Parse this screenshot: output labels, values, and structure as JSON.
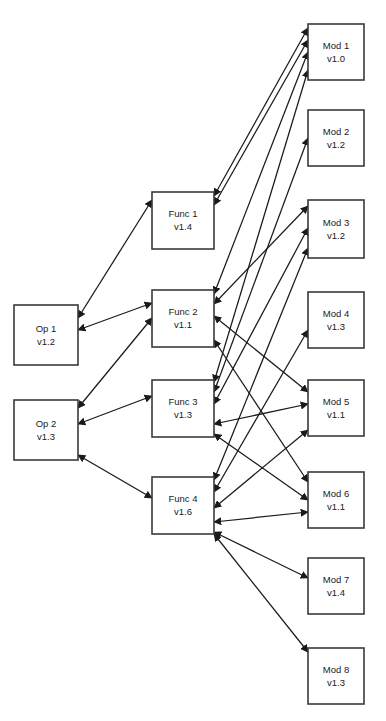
{
  "diagram": {
    "type": "directed-graph",
    "canvas": {
      "width": 386,
      "height": 721,
      "background": "#ffffff"
    },
    "style": {
      "node_fill": "#ffffff",
      "node_stroke": "#3a3a3a",
      "edge_color": "#1a1a1a",
      "text_color": "#1a1a1a"
    },
    "columns": [
      {
        "id": "ops",
        "label": "Op"
      },
      {
        "id": "funcs",
        "label": "Func"
      },
      {
        "id": "mods",
        "label": "Mod"
      }
    ],
    "nodes": [
      {
        "id": "op1",
        "name": "Op 1",
        "version": "v1.2",
        "x": 14,
        "y": 305,
        "w": 64,
        "h": 60,
        "column": "ops"
      },
      {
        "id": "op2",
        "name": "Op 2",
        "version": "v1.3",
        "x": 14,
        "y": 400,
        "w": 64,
        "h": 60,
        "column": "ops"
      },
      {
        "id": "func1",
        "name": "Func 1",
        "version": "v1.4",
        "x": 152,
        "y": 192,
        "w": 62,
        "h": 57,
        "column": "funcs"
      },
      {
        "id": "func2",
        "name": "Func 2",
        "version": "v1.1",
        "x": 152,
        "y": 290,
        "w": 62,
        "h": 57,
        "column": "funcs"
      },
      {
        "id": "func3",
        "name": "Func 3",
        "version": "v1.3",
        "x": 152,
        "y": 380,
        "w": 62,
        "h": 57,
        "column": "funcs"
      },
      {
        "id": "func4",
        "name": "Func 4",
        "version": "v1.6",
        "x": 152,
        "y": 477,
        "w": 62,
        "h": 57,
        "column": "funcs"
      },
      {
        "id": "mod1",
        "name": "Mod 1",
        "version": "v1.0",
        "x": 308,
        "y": 24,
        "w": 56,
        "h": 56,
        "column": "mods"
      },
      {
        "id": "mod2",
        "name": "Mod 2",
        "version": "v1.2",
        "x": 308,
        "y": 110,
        "w": 56,
        "h": 56,
        "column": "mods"
      },
      {
        "id": "mod3",
        "name": "Mod 3",
        "version": "v1.2",
        "x": 308,
        "y": 200,
        "w": 56,
        "h": 58,
        "column": "mods"
      },
      {
        "id": "mod4",
        "name": "Mod 4",
        "version": "v1.3",
        "x": 308,
        "y": 292,
        "w": 56,
        "h": 56,
        "column": "mods"
      },
      {
        "id": "mod5",
        "name": "Mod 5",
        "version": "v1.1",
        "x": 308,
        "y": 380,
        "w": 56,
        "h": 56,
        "column": "mods"
      },
      {
        "id": "mod6",
        "name": "Mod 6",
        "version": "v1.1",
        "x": 308,
        "y": 472,
        "w": 56,
        "h": 56,
        "column": "mods"
      },
      {
        "id": "mod7",
        "name": "Mod 7",
        "version": "v1.4",
        "x": 308,
        "y": 558,
        "w": 56,
        "h": 56,
        "column": "mods"
      },
      {
        "id": "mod8",
        "name": "Mod 8",
        "version": "v1.3",
        "x": 308,
        "y": 648,
        "w": 56,
        "h": 56,
        "column": "mods"
      }
    ],
    "edges": [
      {
        "id": "e1",
        "from": "op1",
        "to": "func1",
        "arrows": "both",
        "x1": 78,
        "y1": 318,
        "x2": 152,
        "y2": 200
      },
      {
        "id": "e2",
        "from": "op1",
        "to": "func2",
        "arrows": "both",
        "x1": 78,
        "y1": 330,
        "x2": 152,
        "y2": 303
      },
      {
        "id": "e3",
        "from": "op2",
        "to": "func2",
        "arrows": "both",
        "x1": 78,
        "y1": 408,
        "x2": 152,
        "y2": 318
      },
      {
        "id": "e4",
        "from": "op2",
        "to": "func3",
        "arrows": "both",
        "x1": 78,
        "y1": 424,
        "x2": 152,
        "y2": 396
      },
      {
        "id": "e5",
        "from": "op2",
        "to": "func4",
        "arrows": "both",
        "x1": 78,
        "y1": 455,
        "x2": 152,
        "y2": 498
      },
      {
        "id": "e6",
        "from": "func1",
        "to": "mod1",
        "arrows": "both",
        "x1": 214,
        "y1": 196,
        "x2": 308,
        "y2": 28
      },
      {
        "id": "e7",
        "from": "func1",
        "to": "mod1",
        "arrows": "both",
        "x1": 214,
        "y1": 205,
        "x2": 308,
        "y2": 40
      },
      {
        "id": "e8",
        "from": "func2",
        "to": "mod1",
        "arrows": "both",
        "x1": 214,
        "y1": 294,
        "x2": 308,
        "y2": 52
      },
      {
        "id": "e9",
        "from": "func2",
        "to": "mod3",
        "arrows": "both",
        "x1": 214,
        "y1": 304,
        "x2": 308,
        "y2": 206
      },
      {
        "id": "e10",
        "from": "func2",
        "to": "mod5",
        "arrows": "both",
        "x1": 214,
        "y1": 316,
        "x2": 308,
        "y2": 392
      },
      {
        "id": "e11",
        "from": "func2",
        "to": "mod6",
        "arrows": "both",
        "x1": 214,
        "y1": 340,
        "x2": 308,
        "y2": 482
      },
      {
        "id": "e12",
        "from": "func3",
        "to": "mod1",
        "arrows": "both",
        "x1": 214,
        "y1": 382,
        "x2": 308,
        "y2": 70
      },
      {
        "id": "e13",
        "from": "func3",
        "to": "mod2",
        "arrows": "both",
        "x1": 214,
        "y1": 392,
        "x2": 308,
        "y2": 138
      },
      {
        "id": "e14",
        "from": "func3",
        "to": "mod3",
        "arrows": "both",
        "x1": 214,
        "y1": 404,
        "x2": 308,
        "y2": 228
      },
      {
        "id": "e15",
        "from": "func3",
        "to": "mod5",
        "arrows": "both",
        "x1": 214,
        "y1": 424,
        "x2": 308,
        "y2": 404
      },
      {
        "id": "e16",
        "from": "func3",
        "to": "mod6",
        "arrows": "both",
        "x1": 214,
        "y1": 434,
        "x2": 308,
        "y2": 500
      },
      {
        "id": "e17",
        "from": "func4",
        "to": "mod3",
        "arrows": "both",
        "x1": 214,
        "y1": 480,
        "x2": 308,
        "y2": 248
      },
      {
        "id": "e18",
        "from": "func4",
        "to": "mod4",
        "arrows": "both",
        "x1": 214,
        "y1": 492,
        "x2": 308,
        "y2": 330
      },
      {
        "id": "e19",
        "from": "func4",
        "to": "mod5",
        "arrows": "both",
        "x1": 214,
        "y1": 508,
        "x2": 308,
        "y2": 430
      },
      {
        "id": "e20",
        "from": "func4",
        "to": "mod6",
        "arrows": "both",
        "x1": 214,
        "y1": 522,
        "x2": 308,
        "y2": 512
      },
      {
        "id": "e21",
        "from": "func4",
        "to": "mod7",
        "arrows": "both",
        "x1": 214,
        "y1": 532,
        "x2": 308,
        "y2": 578
      },
      {
        "id": "e22",
        "from": "func4",
        "to": "mod8",
        "arrows": "both",
        "x1": 214,
        "y1": 534,
        "x2": 308,
        "y2": 652
      }
    ]
  }
}
